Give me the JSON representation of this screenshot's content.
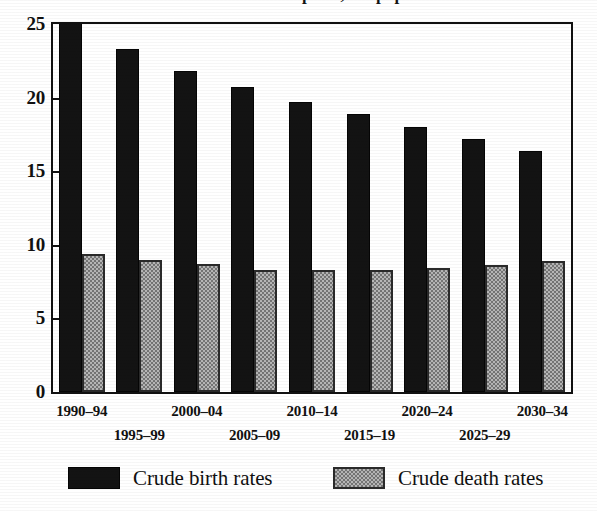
{
  "figure": {
    "title_remnant": "crude birth and death rates per 1,000 population",
    "background_color": "#ffffff",
    "frame_color": "#111111"
  },
  "chart_data": {
    "type": "bar",
    "title": "",
    "xlabel": "",
    "ylabel": "",
    "ylim": [
      0,
      25
    ],
    "yticks": [
      0,
      5,
      10,
      15,
      20,
      25
    ],
    "ytick_labels": [
      "0",
      "5",
      "10",
      "15",
      "20",
      "25"
    ],
    "grid": false,
    "legend_position": "bottom",
    "categories": [
      "1990–94",
      "1995–99",
      "2000–04",
      "2005–09",
      "2010–14",
      "2015–19",
      "2020–24",
      "2025–29",
      "2030–34"
    ],
    "series": [
      {
        "name": "Crude birth rates",
        "color": "#131313",
        "fill": "solid-black",
        "values": [
          26.2,
          23.3,
          21.8,
          20.7,
          19.7,
          18.9,
          18.0,
          17.2,
          16.4
        ],
        "clipped_at_top": [
          true,
          false,
          false,
          false,
          false,
          false,
          false,
          false,
          false
        ]
      },
      {
        "name": "Crude death rates",
        "color": "#b6b6b6",
        "fill": "gray-checker",
        "values": [
          9.4,
          9.0,
          8.7,
          8.3,
          8.3,
          8.3,
          8.4,
          8.6,
          8.9
        ],
        "clipped_at_top": [
          false,
          false,
          false,
          false,
          false,
          false,
          false,
          false,
          false
        ]
      }
    ]
  },
  "legend": {
    "entries": [
      {
        "label": "Crude birth rates",
        "swatch": "solid-black"
      },
      {
        "label": "Crude death rates",
        "swatch": "gray-checker"
      }
    ]
  }
}
